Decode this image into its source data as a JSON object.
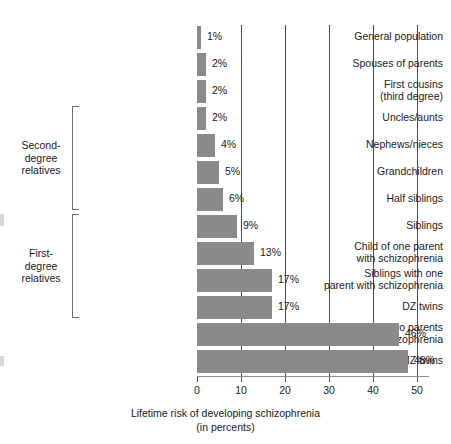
{
  "chart_data": {
    "type": "bar",
    "orientation": "horizontal",
    "title": "",
    "xlabel": "Lifetime risk of developing schizophrenia\n(in percents)",
    "ylabel": "",
    "xlim": [
      0,
      50
    ],
    "xticks": [
      0,
      10,
      20,
      30,
      40,
      50
    ],
    "xtick_labels": [
      "0",
      "10",
      "20",
      "30",
      "40",
      "50"
    ],
    "grid": "vertical",
    "legend": "none",
    "bar_color": "#8a8a8a",
    "categories": [
      "General population",
      "Spouses of parents",
      "First cousins\n(third degree)",
      "Uncles/aunts",
      "Nephews/nieces",
      "Grandchildren",
      "Half siblings",
      "Siblings",
      "Child of one parent\nwith schizophrenia",
      "Siblings with one\nparent with schizophrenia",
      "DZ twins",
      "Child of two parents\nwith schizophrenia",
      "MZ twins"
    ],
    "values": [
      1,
      2,
      2,
      2,
      4,
      5,
      6,
      9,
      13,
      17,
      17,
      46,
      48
    ],
    "value_labels": [
      "1%",
      "2%",
      "2%",
      "2%",
      "4%",
      "5%",
      "6%",
      "9%",
      "13%",
      "17%",
      "17%",
      "46%",
      "48%"
    ],
    "groups": [
      {
        "label": "Second-\ndegree\nrelatives",
        "first_index": 3,
        "last_index": 6
      },
      {
        "label": "First-\ndegree\nrelatives",
        "first_index": 7,
        "last_index": 10
      }
    ]
  }
}
